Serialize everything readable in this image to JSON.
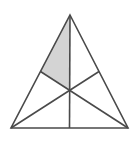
{
  "figure": {
    "shape_name": "triangle-with-medians",
    "background_color": "#ffffff",
    "stroke_color": "#4a4a4a",
    "shaded_fill_color": "#d4d4d4",
    "stroke_width": 1.6,
    "canvas": {
      "width": 138,
      "height": 150
    },
    "vertices": {
      "apex": {
        "label": "A",
        "x": 70,
        "y": 15
      },
      "bottom_left": {
        "label": "B",
        "x": 11,
        "y": 128
      },
      "bottom_right": {
        "label": "C",
        "x": 128,
        "y": 128
      }
    },
    "midpoints": {
      "left_side": {
        "label": "M_AB",
        "x": 40.5,
        "y": 71.5
      },
      "right_side": {
        "label": "M_AC",
        "x": 99,
        "y": 71.5
      },
      "bottom_side": {
        "label": "M_BC",
        "x": 69.5,
        "y": 128
      }
    },
    "centroid": {
      "label": "G",
      "x": 69.67,
      "y": 90.33
    },
    "outline_path": "M 70 15 L 128 128 L 11 128 Z",
    "medians": [
      {
        "name": "median-apex-to-bottom-midpoint",
        "from": "apex",
        "to": "bottom_side",
        "path": "M 70 15 L 69.5 128"
      },
      {
        "name": "median-bottom-left-to-right-midpoint",
        "from": "bottom_left",
        "to": "right_side",
        "path": "M 11 128 L 99 71.5"
      },
      {
        "name": "median-bottom-right-to-left-midpoint",
        "from": "bottom_right",
        "to": "left_side",
        "path": "M 128 128 L 40.5 71.5"
      }
    ],
    "shaded_region": {
      "name": "shaded-upper-left-region",
      "description": "Quadrilateral bounded by apex, vertical median down to centroid, centroid to left-side midpoint, and left side back up to apex",
      "path": "M 70 15 L 69.67 90.33 L 40.5 71.5 Z",
      "corner_points": [
        {
          "x": 70,
          "y": 15
        },
        {
          "x": 69.67,
          "y": 90.33
        },
        {
          "x": 40.5,
          "y": 71.5
        }
      ],
      "fraction_of_triangle": "1/6"
    },
    "sub_regions_count": 6
  }
}
